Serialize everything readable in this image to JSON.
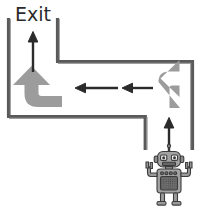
{
  "scene": {
    "title": "Robot maze path puzzle",
    "width": 200,
    "height": 210,
    "background_color": "#ffffff"
  },
  "labels": {
    "exit": "Exit"
  },
  "colors": {
    "wall": "#5a5a5a",
    "wall_highlight": "#8c8c8c",
    "arrow_black": "#2b2b2b",
    "arrow_gray": "#999999",
    "text": "#2b2b2b",
    "robot_body": "#9a9a9a",
    "robot_outline": "#3c3c3c",
    "robot_panel": "#6e6e6e"
  },
  "walls": [
    {
      "name": "outer-left-vertical",
      "x1": 8,
      "y1": 18,
      "x2": 8,
      "y2": 116
    },
    {
      "name": "outer-bottom-horizontal",
      "x1": 8,
      "y1": 116,
      "x2": 146,
      "y2": 116
    },
    {
      "name": "outer-right-stub-vertical",
      "x1": 146,
      "y1": 116,
      "x2": 146,
      "y2": 150
    },
    {
      "name": "inner-left-vertical",
      "x1": 57,
      "y1": 18,
      "x2": 57,
      "y2": 61
    },
    {
      "name": "inner-top-horizontal",
      "x1": 57,
      "y1": 61,
      "x2": 193,
      "y2": 61
    },
    {
      "name": "inner-right-vertical",
      "x1": 193,
      "y1": 61,
      "x2": 193,
      "y2": 150
    }
  ],
  "arrows": [
    {
      "name": "arrow-up-to-exit",
      "style": "straight",
      "color": "black",
      "direction": "up",
      "from": [
        33,
        72
      ],
      "to": [
        33,
        33
      ]
    },
    {
      "name": "arrow-left-segment-1",
      "style": "straight",
      "color": "black",
      "direction": "left",
      "from": [
        118,
        88
      ],
      "to": [
        75,
        88
      ]
    },
    {
      "name": "arrow-left-segment-2",
      "style": "straight",
      "color": "black",
      "direction": "left",
      "from": [
        153,
        88
      ],
      "to": [
        122,
        88
      ]
    },
    {
      "name": "arrow-up-from-robot",
      "style": "straight",
      "color": "black",
      "direction": "up",
      "from": [
        169,
        155
      ],
      "to": [
        169,
        118
      ]
    },
    {
      "name": "turn-arrow-left-corner",
      "style": "curved",
      "color": "gray",
      "direction": "turn-up",
      "description": "enters from the right along the lower corridor, turns upward toward the exit"
    },
    {
      "name": "turn-arrow-right-corner",
      "style": "curved",
      "color": "gray",
      "direction": "turn-left",
      "description": "enters from below on the right side, turns left into the corridor"
    }
  ],
  "robot": {
    "name": "robot",
    "position": [
      169,
      178
    ],
    "pose": "arms-raised",
    "features": {
      "antenna_count": 1,
      "eye_count": 2,
      "mouth": "grill",
      "chest_buttons": 4,
      "chest_panel": "speaker-grid",
      "leg_count": 2,
      "arm_count": 2
    }
  }
}
